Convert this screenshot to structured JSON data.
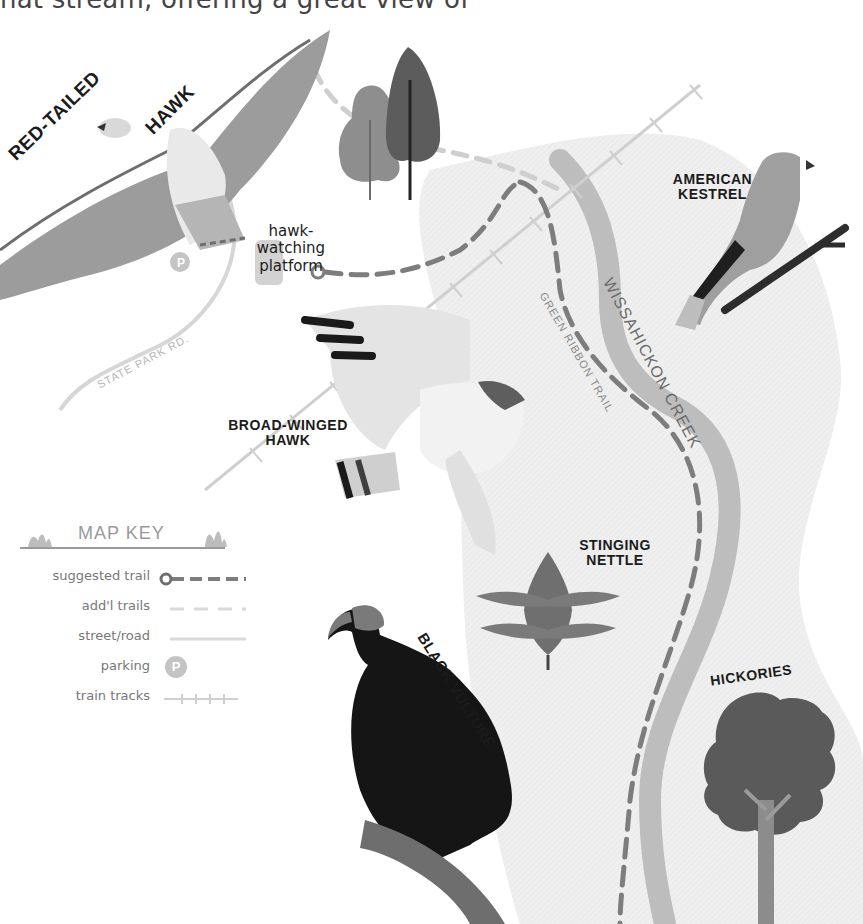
{
  "header": {
    "partial_text": "hat stream, offering a great view of"
  },
  "labels": {
    "red_tailed": "RED-TAILED",
    "hawk": "HAWK",
    "hawk_watching_line1": "hawk-watching",
    "hawk_watching_line2": "platform",
    "american_kestrel_line1": "AMERICAN",
    "american_kestrel_line2": "KESTREL",
    "wissahickon_creek": "WISSAHICKON CREEK",
    "green_ribbon_trail": "GREEN RIBBON TRAIL",
    "state_park_rd": "STATE PARK RD.",
    "broad_winged_line1": "BROAD-WINGED",
    "broad_winged_line2": "HAWK",
    "stinging_nettle_line1": "STINGING",
    "stinging_nettle_line2": "NETTLE",
    "black_vulture": "BLACK VULTURE",
    "hickories": "HICKORIES",
    "parking_symbol": "P"
  },
  "map_key": {
    "title": "MAP KEY",
    "items": [
      {
        "label": "suggested trail",
        "symbol": "trail-start-dashed"
      },
      {
        "label": "add'l trails",
        "symbol": "light-dashed"
      },
      {
        "label": "street/road",
        "symbol": "solid-line"
      },
      {
        "label": "parking",
        "symbol": "P"
      },
      {
        "label": "train tracks",
        "symbol": "tracks"
      }
    ]
  },
  "colors": {
    "background": "#ffffff",
    "text_dark": "#1b1b1b",
    "trail_gray": "#7d7d7d",
    "light_trail": "#cfcfcf",
    "creek": "#bdbdbd",
    "shaded_area": "#efefef",
    "vulture": "#151515",
    "tree_dark": "#555555",
    "tree_mid": "#888888"
  }
}
